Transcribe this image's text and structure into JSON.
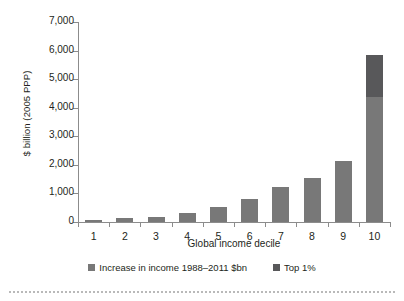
{
  "chart_data": {
    "type": "bar",
    "title": "",
    "subtitle": "",
    "xlabel": "Global income decile",
    "ylabel": "$ billion (2005 PPP)",
    "categories": [
      "1",
      "2",
      "3",
      "4",
      "5",
      "6",
      "7",
      "8",
      "9",
      "10"
    ],
    "ylim": [
      0,
      7000
    ],
    "yticks": [
      0,
      1000,
      2000,
      3000,
      4000,
      5000,
      6000,
      7000
    ],
    "ytick_labels": [
      "0",
      "1,000",
      "2,000",
      "3,000",
      "4,000",
      "5,000",
      "6,000",
      "7,000"
    ],
    "grid": false,
    "stacked": true,
    "legend_position": "bottom",
    "series": [
      {
        "name": "Increase in income 1988–2011 $bn",
        "color": "#787878",
        "values": [
          60,
          130,
          190,
          300,
          540,
          820,
          1210,
          1540,
          2120,
          4380
        ]
      },
      {
        "name": "Top 1%",
        "color": "#58585a",
        "values": [
          0,
          0,
          0,
          0,
          0,
          0,
          0,
          0,
          0,
          1470
        ]
      }
    ],
    "totals": [
      60,
      130,
      190,
      300,
      540,
      820,
      1210,
      1540,
      2120,
      5850
    ]
  },
  "legend": {
    "items": [
      {
        "label": "Increase in income 1988–2011 $bn",
        "color": "#787878"
      },
      {
        "label": "Top 1%",
        "color": "#58585a"
      }
    ]
  },
  "axes": {
    "y_title": "$ billion (2005 PPP)",
    "x_title": "Global income decile"
  }
}
